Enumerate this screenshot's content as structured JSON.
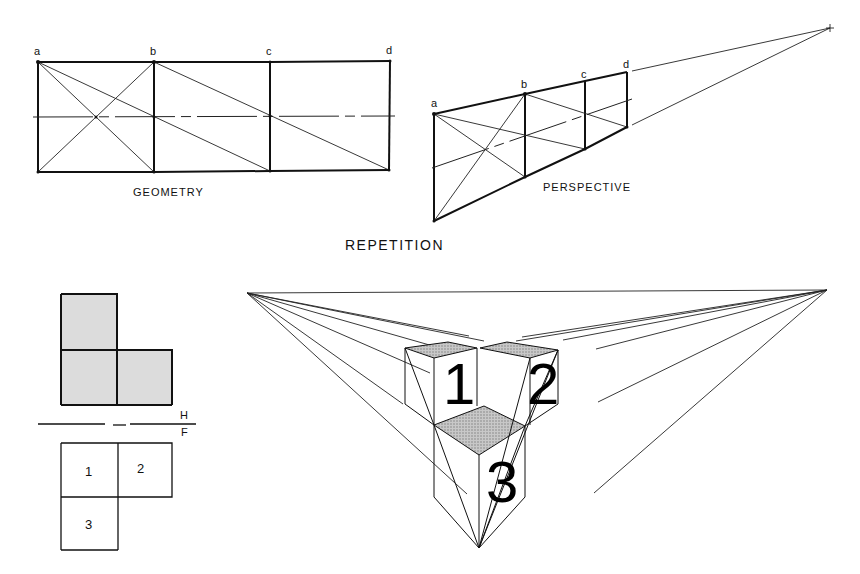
{
  "figure": {
    "title": "REPETITION",
    "geometry_panel": {
      "caption": "GEOMETRY",
      "point_labels": [
        "a",
        "b",
        "c",
        "d"
      ]
    },
    "perspective_panel": {
      "caption": "PERSPECTIVE",
      "point_labels": [
        "a",
        "b",
        "c",
        "d"
      ]
    },
    "plan_panel": {
      "horizon_label_top": "H",
      "horizon_label_bottom": "F",
      "square_labels": [
        "1",
        "2",
        "3"
      ]
    },
    "cube_panel": {
      "cube_labels": [
        "1",
        "2",
        "3"
      ]
    },
    "colors": {
      "line": "#111111",
      "shaded_fill": "#d9d9d9",
      "hatched_fill": "#a8a8a8",
      "background": "#ffffff"
    }
  }
}
